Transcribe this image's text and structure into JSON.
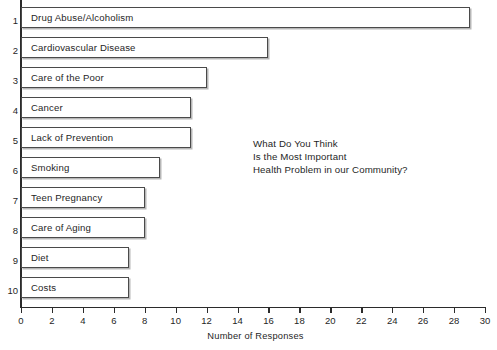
{
  "chart_data": {
    "type": "bar",
    "orientation": "horizontal",
    "title": "",
    "annotation_lines": [
      "What Do You Think",
      "Is the Most Important",
      "Health Problem in our Community?"
    ],
    "xlabel": "Number of Responses",
    "ylabel": "",
    "xlim": [
      0,
      30
    ],
    "xticks": [
      0,
      2,
      4,
      6,
      8,
      10,
      12,
      14,
      16,
      18,
      20,
      22,
      24,
      26,
      28,
      30
    ],
    "xtick_labels": [
      "0",
      "2",
      "4",
      "6",
      "8",
      "10",
      "12",
      "14",
      "16",
      "18",
      "20",
      "22",
      "24",
      "26",
      "28",
      "30"
    ],
    "grid": false,
    "legend": false,
    "rank_labels": [
      "1",
      "2",
      "3",
      "4",
      "5",
      "6",
      "7",
      "8",
      "9",
      "10"
    ],
    "categories": [
      "Drug Abuse/Alcoholism",
      "Cardiovascular Disease",
      "Care of the Poor",
      "Cancer",
      "Lack of Prevention",
      "Smoking",
      "Teen Pregnancy",
      "Care of Aging",
      "Diet",
      "Costs"
    ],
    "values": [
      29,
      16,
      12,
      11,
      11,
      9,
      8,
      8,
      7,
      7
    ],
    "bar_fill": "#ffffff",
    "bar_stroke": "#4a4a4a",
    "axis_color": "#2b2b2b"
  }
}
